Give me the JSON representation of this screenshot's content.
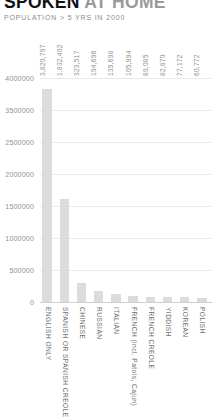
{
  "header": {
    "title_strong": "SPOKEN",
    "title_light": "AT HOME",
    "subtitle": "POPULATION > 5 YRS IN 2000"
  },
  "colors": {
    "bar": "#dcdcdc",
    "gridline": "#e8e8e8",
    "baseline": "#cfcfcf",
    "tick_text": "#8f8f8f",
    "category_text": "#6e6e6e",
    "title_strong": "#111111",
    "title_light": "#9a9a9a",
    "background": "#ffffff"
  },
  "chart_data": {
    "type": "bar",
    "title": "SPOKEN AT HOME",
    "subtitle": "POPULATION > 5 YRS IN 2000",
    "xlabel": "",
    "ylabel": "",
    "ylim": [
      0,
      4000000
    ],
    "grid": true,
    "legend": "none",
    "orientation": "vertical",
    "categories": [
      "ENGLISH ONLY",
      "SPANISH OR SPANISH CREOLE",
      "CHINESE",
      "RUSSIAN",
      "ITALIAN",
      "FRENCH (incl. Patois, Cajun)",
      "FRENCH CREOLE",
      "YIDDISH",
      "KOREAN",
      "POLISH"
    ],
    "values": [
      3820797,
      1832402,
      323517,
      194696,
      139698,
      105994,
      89085,
      82870,
      77172,
      60772
    ],
    "value_labels": [
      "3,820,797",
      "1,832,402",
      "323,517",
      "194,696",
      "139,698",
      "105,994",
      "89,085",
      "82,870",
      "77,172",
      "60,772"
    ],
    "yticks": [
      4000000,
      3500000,
      2500000,
      2000000,
      1500000,
      1000000,
      500000,
      0
    ],
    "ytick_labels": [
      "4000000",
      "3500000",
      "2500000",
      "2000000",
      "1500000",
      "1000000",
      "500000",
      "0"
    ]
  }
}
